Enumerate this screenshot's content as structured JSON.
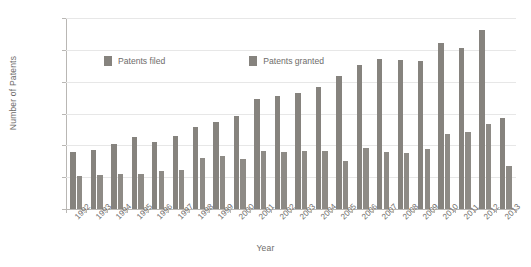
{
  "chart_data": {
    "type": "bar",
    "title": "",
    "xlabel": "Year",
    "ylabel": "Number of Patents",
    "ylim": [
      0,
      600000
    ],
    "ytick_labels": [
      "0",
      "100,000",
      "200,000",
      "300,000",
      "400,000",
      "500,000",
      "600,000"
    ],
    "ytick_values": [
      0,
      100000,
      200000,
      300000,
      400000,
      500000,
      600000
    ],
    "grid": true,
    "legend_position": "top-center",
    "categories": [
      "1992",
      "1993",
      "1994",
      "1995",
      "1996",
      "1997",
      "1998",
      "1999",
      "2000",
      "2001",
      "2002",
      "2003",
      "2004",
      "2005",
      "2006",
      "2007",
      "2008",
      "2009",
      "2010",
      "2011",
      "2012",
      "2013"
    ],
    "series": [
      {
        "name": "Patents filed",
        "color": "#86837e",
        "values": [
          180000,
          186000,
          203000,
          226000,
          210000,
          230000,
          259000,
          272000,
          293000,
          345000,
          355000,
          366000,
          382000,
          418000,
          451000,
          472000,
          469000,
          464000,
          521000,
          507000,
          562000,
          285000
        ]
      },
      {
        "name": "Patents granted",
        "color": "#8e8b86",
        "values": [
          103000,
          106000,
          110000,
          111000,
          118000,
          122000,
          161000,
          168000,
          158000,
          182000,
          180000,
          182000,
          181000,
          152000,
          192000,
          179000,
          177000,
          190000,
          237000,
          243000,
          268000,
          134000
        ]
      }
    ]
  },
  "legend": {
    "items": [
      {
        "label": "Patents filed"
      },
      {
        "label": "Patents granted"
      }
    ]
  }
}
